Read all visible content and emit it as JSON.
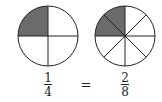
{
  "diagram": {
    "colors": {
      "shade": "#6b6b6b",
      "stroke": "#222222",
      "background": "#ffffff"
    },
    "left_circle": {
      "parts": 4,
      "shaded_parts": 1,
      "shaded_region": "top-left quadrant"
    },
    "right_circle": {
      "parts": 8,
      "shaded_parts": 2,
      "shaded_region": "top-left quadrant (two eighths)"
    },
    "equation": {
      "left": {
        "numerator": "1",
        "denominator": "4"
      },
      "operator": "=",
      "right": {
        "numerator": "2",
        "denominator": "8"
      }
    }
  }
}
